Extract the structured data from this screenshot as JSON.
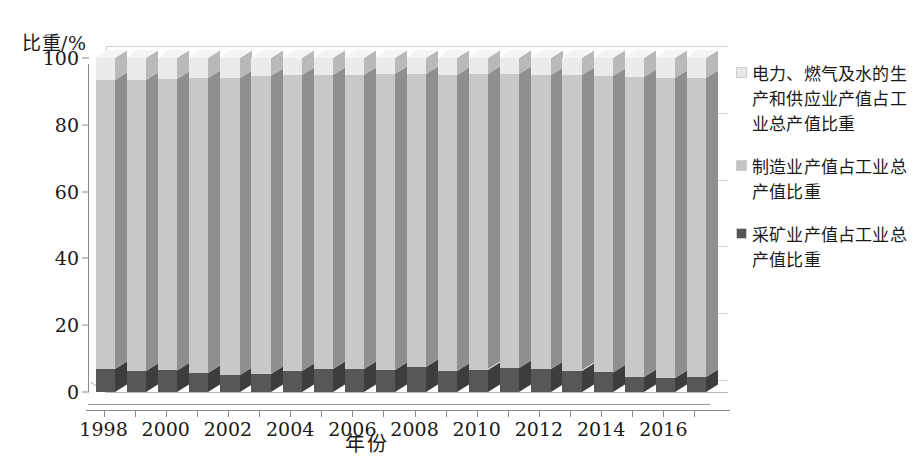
{
  "chart_data": {
    "type": "bar",
    "subtype": "stacked-column-3d",
    "title": "",
    "xlabel": "年份",
    "ylabel": "比重/%",
    "ylim": [
      0,
      100
    ],
    "yticks": [
      0,
      20,
      40,
      60,
      80,
      100
    ],
    "grid": true,
    "legend_position": "right",
    "stacked": true,
    "stack_total": 100,
    "categories": [
      "1998",
      "1999",
      "2000",
      "2001",
      "2002",
      "2003",
      "2004",
      "2005",
      "2006",
      "2007",
      "2008",
      "2009",
      "2010",
      "2011",
      "2012",
      "2013",
      "2014",
      "2015",
      "2016",
      "2017"
    ],
    "xtick_labels": [
      "1998",
      "2000",
      "2002",
      "2004",
      "2006",
      "2008",
      "2010",
      "2012",
      "2014",
      "2016"
    ],
    "series": [
      {
        "name": "采矿业产值占工业总产值比重",
        "color": "#555555",
        "order": 0,
        "values": [
          6.8,
          6.3,
          6.5,
          5.6,
          5.2,
          5.4,
          6.2,
          6.8,
          7.0,
          6.6,
          7.4,
          6.2,
          6.7,
          7.2,
          6.8,
          6.4,
          5.9,
          4.6,
          4.2,
          4.4
        ]
      },
      {
        "name": "制造业产值占工业总产值比重",
        "color": "#c4c4c4",
        "order": 1,
        "values": [
          86.5,
          87.1,
          87.3,
          88.3,
          88.9,
          89.1,
          88.6,
          88.1,
          88.0,
          88.5,
          87.8,
          88.6,
          88.4,
          87.9,
          88.1,
          88.4,
          88.8,
          89.7,
          89.9,
          89.6
        ]
      },
      {
        "name": "电力、燃气及水的生产和供应业产值占工业总产值比重",
        "color": "#e8e8e8",
        "order": 2,
        "values": [
          6.7,
          6.6,
          6.2,
          6.1,
          5.9,
          5.5,
          5.2,
          5.1,
          5.0,
          4.9,
          4.8,
          5.2,
          4.9,
          4.9,
          5.1,
          5.2,
          5.3,
          5.7,
          5.9,
          6.0
        ]
      }
    ]
  },
  "legend": {
    "items": [
      {
        "label": "电力、燃气及水的生产和供应业产值占工业总产值比重",
        "color": "#e8e8e8"
      },
      {
        "label": "制造业产值占工业总产值比重",
        "color": "#c4c4c4"
      },
      {
        "label": "采矿业产值占工业总产值比重",
        "color": "#555555"
      }
    ]
  },
  "axes": {
    "y_title": "比重/%",
    "x_title": "年份"
  },
  "colors": {
    "mining_front": "#575757",
    "mining_side": "#3d3d3d",
    "mining_top": "#6e6e6e",
    "manufacturing_front": "#c8c8c8",
    "manufacturing_side": "#8f8f8f",
    "manufacturing_top": "#d9d9d9",
    "utilities_front": "#ebebeb",
    "utilities_side": "#b9b9b9",
    "utilities_top": "#f4f4f4",
    "axis": "#8a8a8a",
    "grid": "#d2d2d2",
    "background": "#ffffff"
  }
}
